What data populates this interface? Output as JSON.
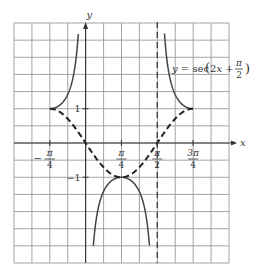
{
  "chart_data": {
    "type": "line",
    "title": "",
    "xlabel": "x",
    "ylabel": "y",
    "function_label": "y = sec (2x + π/2)",
    "function_label_parts": {
      "prefix": "y = sec",
      "arg_open": "(2x + ",
      "frac_num": "π",
      "frac_den": "2",
      "arg_close": ")"
    },
    "x_ticks": [
      {
        "value": -0.7853981634,
        "num": "π",
        "den": "4",
        "sign": "−"
      },
      {
        "value": 0.7853981634,
        "num": "π",
        "den": "4",
        "sign": ""
      },
      {
        "value": 1.5707963268,
        "num": "π",
        "den": "2",
        "sign": ""
      },
      {
        "value": 2.3561944902,
        "num": "3π",
        "den": "4",
        "sign": ""
      }
    ],
    "y_ticks": [
      {
        "value": 1,
        "label": "1"
      },
      {
        "value": -1,
        "label": "−1"
      }
    ],
    "xlim": [
      -1.5708,
      3.1416
    ],
    "ylim": [
      -3.5,
      3.5
    ],
    "grid": true,
    "asymptotes": [
      {
        "x": 0,
        "drawn": false
      },
      {
        "x": 1.5707963268,
        "drawn": true,
        "style": "dashed"
      }
    ],
    "series": [
      {
        "name": "y = sec(2x + π/2)",
        "style": "solid",
        "segments": [
          {
            "domain": [
              -0.7854,
              -0.16
            ],
            "note": "upper branch from (−π/4, 1) rising to +∞ at x=0"
          },
          {
            "domain": [
              0.17,
              1.4
            ],
            "note": "lower branch, max (π/4, −1), falling to −∞ at x=0 and x=π/2"
          },
          {
            "domain": [
              1.73,
              2.3562
            ],
            "note": "upper branch from +∞ at x=π/2 down to (3π/4, 1)"
          }
        ],
        "key_points": [
          [
            -0.7854,
            1
          ],
          [
            0.7854,
            -1
          ],
          [
            2.3562,
            1
          ]
        ]
      },
      {
        "name": "y = cos(2x + π/2)",
        "style": "dashed",
        "domain": [
          -0.7854,
          2.3562
        ],
        "key_points": [
          [
            -0.7854,
            1
          ],
          [
            0,
            0
          ],
          [
            0.7854,
            -1
          ],
          [
            1.5708,
            0
          ],
          [
            2.3562,
            1
          ]
        ]
      }
    ]
  },
  "colors": {
    "grid": "#9a9a9a",
    "axis": "#333333",
    "curve": "#444444",
    "dashed": "#222222"
  }
}
